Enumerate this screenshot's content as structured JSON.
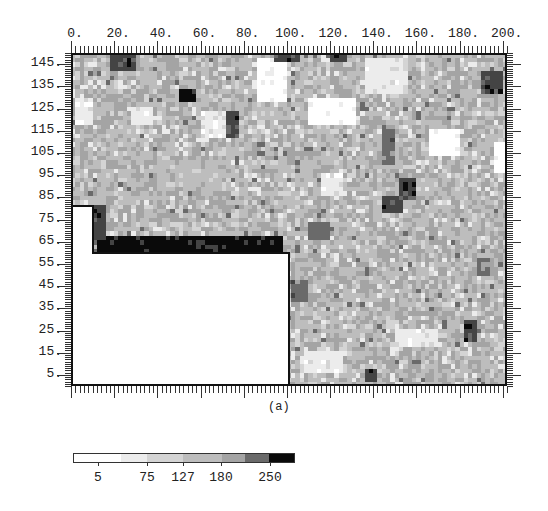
{
  "chart_data": {
    "type": "heatmap",
    "title": "",
    "caption": "(a)",
    "xlabel": "",
    "ylabel": "",
    "xlim": [
      0,
      202
    ],
    "ylim": [
      0,
      150
    ],
    "x_ticks": [
      "0.",
      "20.",
      "40.",
      "60.",
      "80.",
      "100.",
      "120.",
      "140.",
      "160.",
      "180.",
      "200."
    ],
    "y_ticks": [
      "145.",
      "135.",
      "125.",
      "115.",
      "105.",
      "95.",
      "85.",
      "75.",
      "65.",
      "55.",
      "45.",
      "35.",
      "25.",
      "15.",
      "5."
    ],
    "colorbar": {
      "tick_labels": [
        "5",
        "75",
        "127",
        "180",
        "250"
      ],
      "levels": [
        "#ffffff",
        "#ececec",
        "#d4d4d4",
        "#bdbdbd",
        "#a4a4a4",
        "#6a6a6a",
        "#444444",
        "#0a0a0a"
      ]
    },
    "masked_region": {
      "description": "blank (no data) L-shaped region in lower left",
      "polygon_data_coords": [
        [
          0,
          0
        ],
        [
          0,
          81
        ],
        [
          10,
          81
        ],
        [
          10,
          60
        ],
        [
          101,
          60
        ],
        [
          101,
          0
        ]
      ]
    },
    "grid_note": "coarse reconstruction, 5-unit cells; values are color-level indices 0(white)-7(black)",
    "cell_size": 5,
    "dark_features": [
      {
        "x": 18,
        "y": 142,
        "w": 12,
        "h": 10,
        "level": 6
      },
      {
        "x": 50,
        "y": 127,
        "w": 8,
        "h": 6,
        "level": 7
      },
      {
        "x": 93,
        "y": 145,
        "w": 12,
        "h": 6,
        "level": 6
      },
      {
        "x": 120,
        "y": 146,
        "w": 8,
        "h": 4,
        "level": 6
      },
      {
        "x": 190,
        "y": 132,
        "w": 10,
        "h": 10,
        "level": 6
      },
      {
        "x": 72,
        "y": 112,
        "w": 6,
        "h": 12,
        "level": 6
      },
      {
        "x": 144,
        "y": 100,
        "w": 6,
        "h": 18,
        "level": 5
      },
      {
        "x": 152,
        "y": 84,
        "w": 8,
        "h": 10,
        "level": 6
      },
      {
        "x": 143,
        "y": 77,
        "w": 10,
        "h": 8,
        "level": 6
      },
      {
        "x": 12,
        "y": 60,
        "w": 86,
        "h": 8,
        "level": 7
      },
      {
        "x": 8,
        "y": 66,
        "w": 8,
        "h": 16,
        "level": 6
      },
      {
        "x": 102,
        "y": 38,
        "w": 8,
        "h": 10,
        "level": 5
      },
      {
        "x": 110,
        "y": 66,
        "w": 10,
        "h": 8,
        "level": 5
      },
      {
        "x": 182,
        "y": 20,
        "w": 6,
        "h": 10,
        "level": 6
      },
      {
        "x": 136,
        "y": 2,
        "w": 6,
        "h": 6,
        "level": 6
      },
      {
        "x": 188,
        "y": 50,
        "w": 6,
        "h": 8,
        "level": 5
      }
    ],
    "light_features": [
      {
        "x": 2,
        "y": 118,
        "w": 8,
        "h": 12,
        "level": 1
      },
      {
        "x": 28,
        "y": 118,
        "w": 10,
        "h": 8,
        "level": 1
      },
      {
        "x": 60,
        "y": 112,
        "w": 16,
        "h": 12,
        "level": 1
      },
      {
        "x": 85,
        "y": 128,
        "w": 14,
        "h": 20,
        "level": 0
      },
      {
        "x": 110,
        "y": 118,
        "w": 22,
        "h": 12,
        "level": 0
      },
      {
        "x": 135,
        "y": 132,
        "w": 20,
        "h": 16,
        "level": 1
      },
      {
        "x": 165,
        "y": 104,
        "w": 14,
        "h": 12,
        "level": 0
      },
      {
        "x": 195,
        "y": 96,
        "w": 8,
        "h": 14,
        "level": 0
      },
      {
        "x": 115,
        "y": 85,
        "w": 10,
        "h": 10,
        "level": 1
      },
      {
        "x": 150,
        "y": 18,
        "w": 20,
        "h": 8,
        "level": 1
      },
      {
        "x": 108,
        "y": 5,
        "w": 18,
        "h": 10,
        "level": 1
      },
      {
        "x": 40,
        "y": 88,
        "w": 30,
        "h": 14,
        "level": 3
      }
    ]
  }
}
